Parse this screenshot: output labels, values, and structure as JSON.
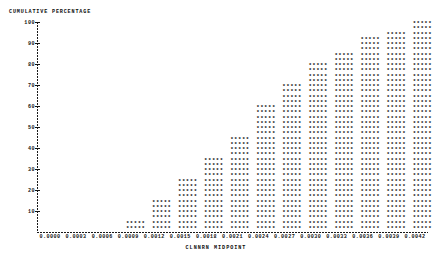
{
  "chart_data": {
    "type": "bar",
    "title": "",
    "subtitle": "",
    "ylabel": "CUMULATIVE PERCENTAGE",
    "xlabel": "CLNNRN MIDPOINT",
    "marker": "*",
    "grid": false,
    "legend": null,
    "ylim": [
      0,
      100
    ],
    "y_ticks": [
      100,
      90,
      80,
      70,
      60,
      50,
      40,
      30,
      20,
      10
    ],
    "y_tick_labels": [
      "100",
      "90",
      "80",
      "70",
      "60",
      "50",
      "40",
      "30",
      "20",
      "10"
    ],
    "xlim": [
      -0.00015,
      0.00435
    ],
    "x_ticks": [
      0.0,
      0.0003,
      0.0006,
      0.0009,
      0.0012,
      0.0015,
      0.0018,
      0.0021,
      0.0024,
      0.0027,
      0.003,
      0.0033,
      0.0036,
      0.0039,
      0.0042
    ],
    "x_tick_labels": [
      "0.0000",
      "0.0003",
      "0.0006",
      "0.0009",
      "0.0012",
      "0.0015",
      "0.0018",
      "0.0021",
      "0.0024",
      "0.0027",
      "0.0030",
      "0.0033",
      "0.0036",
      "0.0039",
      "0.0042"
    ],
    "categories": [
      0.001,
      0.0013,
      0.0016,
      0.0019,
      0.0022,
      0.0025,
      0.0028,
      0.0031,
      0.0034,
      0.0037,
      0.004,
      0.0043
    ],
    "values": [
      6,
      15,
      24,
      34,
      46,
      59,
      70,
      79,
      86,
      92,
      96,
      100
    ],
    "annotations": []
  }
}
